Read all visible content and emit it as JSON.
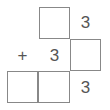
{
  "puzzle": {
    "type": "column-addition",
    "operator": "+",
    "rows": [
      {
        "cells": [
          "",
          "[box]",
          "3"
        ]
      },
      {
        "cells": [
          "+",
          "3",
          "[box]"
        ]
      },
      {
        "cells": [
          "[box]",
          "[box]",
          "3"
        ]
      }
    ],
    "labels": {
      "top_ones": "3",
      "mid_tens": "3",
      "bottom_ones": "3",
      "plus": "+"
    }
  }
}
